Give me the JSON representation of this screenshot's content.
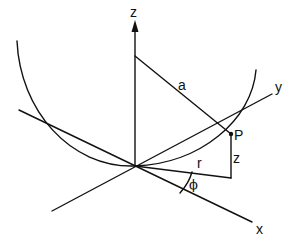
{
  "diagram": {
    "type": "spherical-coordinate-geometry",
    "colors": {
      "stroke": "#111111",
      "background": "#ffffff"
    },
    "axes": {
      "z": {
        "label": "z"
      },
      "y": {
        "label": "y"
      },
      "x": {
        "label": "x"
      }
    },
    "labels": {
      "radius_a": "a",
      "point": "P",
      "height_z": "z",
      "radius_r": "r",
      "angle": "ϕ"
    }
  }
}
